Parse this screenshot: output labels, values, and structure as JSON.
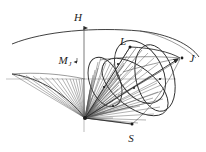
{
  "figure": {
    "background_color": "#ffffff",
    "ink_color": "#2b2b2b",
    "width": 206,
    "height": 152
  },
  "labels": {
    "field_axis": "H",
    "magnetic_moment": "M",
    "magnetic_moment_subscript": "J",
    "orbital_angular_momentum": "L",
    "total_angular_momentum": "J",
    "spin_angular_momentum": "S"
  },
  "label_positions": {
    "H": {
      "x": 82,
      "y": 20
    },
    "M": {
      "x": 61,
      "y": 63
    },
    "M_sub": {
      "x": 68,
      "y": 66
    },
    "L": {
      "x": 122,
      "y": 44
    },
    "J": {
      "x": 190,
      "y": 60
    },
    "S": {
      "x": 131,
      "y": 141
    }
  },
  "vector_tips": {
    "H": {
      "x": 84,
      "y": 23
    },
    "M_J": {
      "x": 84,
      "y": 62
    },
    "L": {
      "x": 130,
      "y": 47
    },
    "J": {
      "x": 182,
      "y": 58
    },
    "S": {
      "x": 132,
      "y": 124
    }
  },
  "geometry": {
    "apex": {
      "x": 85,
      "y": 118
    },
    "vertical_axis": {
      "x1": 84,
      "y1": 23,
      "x2": 84,
      "y2": 132
    },
    "horizontal_plane_y": 79,
    "outer_arc": {
      "left_x": 12,
      "right_x": 198,
      "apex_y": 35
    },
    "left_cone_rim": {
      "left_x": 12,
      "y": 74
    }
  },
  "elements": {
    "H_axis_arrow": "upward-arrow",
    "M_J_arrow": "upward-arrow",
    "J_arrow": "right-arrow",
    "cone_count": 3,
    "hatching": "radial-line-fan"
  }
}
